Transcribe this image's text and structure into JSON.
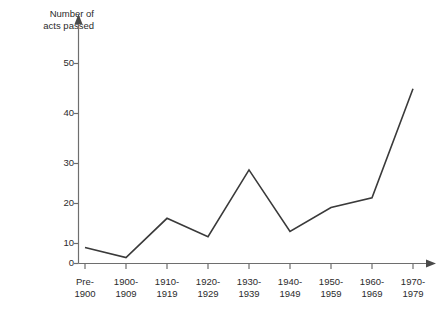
{
  "chart_data": {
    "type": "line",
    "title": "",
    "ylabel": "Number of\nacts passed",
    "xlabel": "",
    "categories": [
      "Pre-\n1900",
      "1900-\n1909",
      "1910-\n1919",
      "1920-\n1929",
      "1930-\n1939",
      "1940-\n1949",
      "1950-\n1959",
      "1960-\n1969",
      "1970-\n1979"
    ],
    "values": [
      4,
      1.5,
      11.3,
      6.7,
      23.4,
      8,
      14,
      16.4,
      43.7
    ],
    "ylim": [
      0,
      56
    ],
    "yticks": [
      0,
      10,
      20,
      30,
      40,
      50
    ],
    "ytick_labels": [
      "0",
      "10",
      "20",
      "30",
      "40",
      "50"
    ],
    "grid": false,
    "legend": "none",
    "line_color": "#3a3a3a",
    "axis_color": "#6e6e6e"
  },
  "caption": ""
}
